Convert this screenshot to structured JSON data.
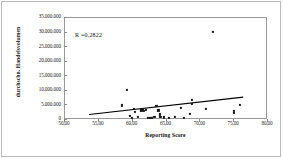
{
  "chart_data": {
    "type": "scatter",
    "title": "",
    "xlabel": "Reporting Score",
    "ylabel": "durchschn. Handelsvolumen",
    "annotation": "R =0,2822",
    "xlim": [
      50.0,
      80.0
    ],
    "ylim": [
      0,
      35000000
    ],
    "xticks": [
      "50,00",
      "55,00",
      "60,00",
      "65,00",
      "70,00",
      "75,00",
      "80,00"
    ],
    "xtick_values": [
      50.0,
      55.0,
      60.0,
      65.0,
      70.0,
      75.0,
      80.0
    ],
    "yticks": [
      "0",
      "5.000.000",
      "10.000.000",
      "15.000.000",
      "20.000.000",
      "25.000.000",
      "30.000.000",
      "35.000.000"
    ],
    "ytick_values": [
      0,
      5000000,
      10000000,
      15000000,
      20000000,
      25000000,
      30000000,
      35000000
    ],
    "grid": false,
    "legend": "none",
    "marker_color": "#151515",
    "line_color": "#000000",
    "points": [
      {
        "x": 58.4,
        "y": 5000000
      },
      {
        "x": 59.2,
        "y": 10400000
      },
      {
        "x": 59.6,
        "y": 1400000
      },
      {
        "x": 59.9,
        "y": 700000
      },
      {
        "x": 60.2,
        "y": 3900000
      },
      {
        "x": 60.3,
        "y": 2900000
      },
      {
        "x": 60.8,
        "y": 1000000
      },
      {
        "x": 61.3,
        "y": 3300000
      },
      {
        "x": 61.5,
        "y": 3600000
      },
      {
        "x": 61.7,
        "y": 3100000
      },
      {
        "x": 62.0,
        "y": 3500000
      },
      {
        "x": 62.2,
        "y": 800000
      },
      {
        "x": 62.6,
        "y": 700000
      },
      {
        "x": 62.9,
        "y": 600000
      },
      {
        "x": 63.2,
        "y": 1100000
      },
      {
        "x": 63.5,
        "y": 4800000
      },
      {
        "x": 63.8,
        "y": 3300000
      },
      {
        "x": 64.0,
        "y": 1900000
      },
      {
        "x": 64.1,
        "y": 1000000
      },
      {
        "x": 64.6,
        "y": 900000
      },
      {
        "x": 65.3,
        "y": 800000
      },
      {
        "x": 66.2,
        "y": 1000000
      },
      {
        "x": 67.1,
        "y": 4100000
      },
      {
        "x": 67.6,
        "y": 800000
      },
      {
        "x": 68.4,
        "y": 2200000
      },
      {
        "x": 68.7,
        "y": 6900000
      },
      {
        "x": 68.8,
        "y": 5400000
      },
      {
        "x": 70.8,
        "y": 3900000
      },
      {
        "x": 71.8,
        "y": 30200000
      },
      {
        "x": 75.0,
        "y": 2300000
      },
      {
        "x": 75.0,
        "y": 3100000
      },
      {
        "x": 75.8,
        "y": 5200000
      }
    ],
    "trendline": {
      "x1": 53.6,
      "y1": 1200000,
      "x2": 76.6,
      "y2": 7300000
    }
  }
}
